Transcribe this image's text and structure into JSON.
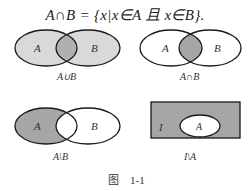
{
  "formula": "A∩B = {x|x∈A 且 x∈B}.",
  "diagrams": [
    {
      "id": "union",
      "set_labels": [
        "A",
        "B"
      ],
      "caption": "A∪B",
      "shaded": "A and B (union), intersection darker"
    },
    {
      "id": "intersection",
      "set_labels": [
        "A",
        "B"
      ],
      "caption": "A∩B",
      "shaded": "intersection"
    },
    {
      "id": "difference",
      "set_labels": [
        "A",
        "B"
      ],
      "caption": "A\\B",
      "shaded": "A minus B"
    },
    {
      "id": "complement",
      "set_labels": [
        "I",
        "A"
      ],
      "caption": "I\\A",
      "shaded": "universe minus A"
    }
  ],
  "figure_caption": {
    "prefix": "图",
    "number": "1-1"
  },
  "colors": {
    "light_fill": "#d9d9d9",
    "mid_fill": "#bdbdbd",
    "dark_fill": "#a6a6a6",
    "stroke": "#1a1a1a"
  }
}
